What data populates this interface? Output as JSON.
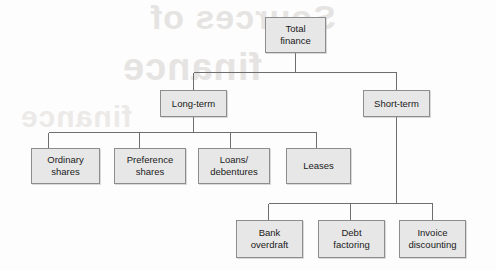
{
  "diagram": {
    "type": "tree-diagram",
    "colors": {
      "box_fill": "#e7e7e7",
      "box_border": "#8d8d8d",
      "connector": "#6e6e6e",
      "text": "#1a1a1a",
      "background": "#fdfdfd",
      "watermark": "#e6e4e2"
    },
    "nodes": {
      "root": {
        "label": "Total\nfinance"
      },
      "long_term": {
        "label": "Long-term"
      },
      "short_term": {
        "label": "Short-term"
      },
      "ordinary_shares": {
        "label": "Ordinary\nshares"
      },
      "preference_shares": {
        "label": "Preference\nshares"
      },
      "loans_debentures": {
        "label": "Loans/\ndebentures"
      },
      "leases": {
        "label": "Leases"
      },
      "bank_overdraft": {
        "label": "Bank\noverdraft"
      },
      "debt_factoring": {
        "label": "Debt\nfactoring"
      },
      "invoice_discounting": {
        "label": "Invoice\ndiscounting"
      }
    },
    "watermark": {
      "line1": "Sources of",
      "line2": "finance",
      "line3": "finance"
    }
  }
}
